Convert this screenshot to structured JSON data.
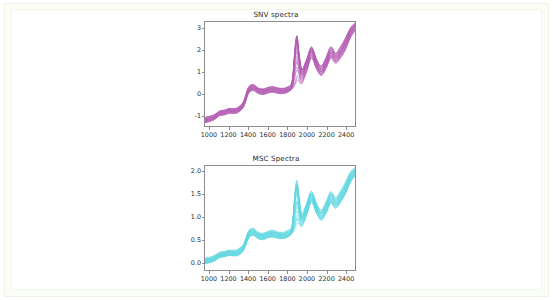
{
  "page": {
    "background_color": "#ffffff",
    "frame_color": "#eef4e6"
  },
  "figure": {
    "panels": [
      {
        "id": "snv",
        "title": "SNV spectra",
        "color": "#b45cb4"
      },
      {
        "id": "msc",
        "title": "MSC Spectra",
        "color": "#5fd6e0"
      }
    ]
  },
  "chart_data": [
    {
      "type": "line",
      "id": "snv-spectra",
      "title": "SNV spectra",
      "xlabel": "",
      "ylabel": "",
      "xlim": [
        950,
        2500
      ],
      "ylim": [
        -1.35,
        3.45
      ],
      "xticks": [
        1000,
        1200,
        1400,
        1600,
        1800,
        2000,
        2200,
        2400
      ],
      "yticks": [
        -1,
        0,
        1,
        2,
        3
      ],
      "grid": false,
      "legend": "none",
      "line_color": "#b45cb4",
      "n_series": 24,
      "x": [
        950,
        1000,
        1050,
        1100,
        1150,
        1200,
        1250,
        1300,
        1350,
        1400,
        1450,
        1500,
        1550,
        1600,
        1650,
        1700,
        1750,
        1800,
        1850,
        1880,
        1900,
        1920,
        1950,
        2000,
        2050,
        2100,
        2150,
        2200,
        2250,
        2300,
        2350,
        2400,
        2450,
        2500
      ],
      "series": [
        {
          "name": "sample-mean",
          "values": [
            -1.08,
            -1.02,
            -0.93,
            -0.76,
            -0.72,
            -0.64,
            -0.66,
            -0.58,
            -0.33,
            0.3,
            0.42,
            0.28,
            0.23,
            0.3,
            0.34,
            0.29,
            0.27,
            0.33,
            0.55,
            1.95,
            2.55,
            1.85,
            1.05,
            1.52,
            2.1,
            1.55,
            1.2,
            1.55,
            2.05,
            1.8,
            2.05,
            2.45,
            2.95,
            3.25
          ]
        },
        {
          "name": "sample-upper-envelope",
          "values": [
            -0.95,
            -0.9,
            -0.82,
            -0.66,
            -0.62,
            -0.54,
            -0.56,
            -0.46,
            -0.2,
            0.45,
            0.56,
            0.4,
            0.36,
            0.43,
            0.47,
            0.41,
            0.39,
            0.45,
            0.72,
            2.2,
            2.78,
            2.05,
            1.28,
            1.72,
            2.3,
            1.76,
            1.42,
            1.8,
            2.3,
            2.02,
            2.3,
            2.7,
            3.15,
            3.4
          ]
        },
        {
          "name": "sample-lower-envelope",
          "values": [
            -1.2,
            -1.14,
            -1.05,
            -0.88,
            -0.84,
            -0.76,
            -0.78,
            -0.7,
            -0.46,
            0.16,
            0.28,
            0.15,
            0.1,
            0.17,
            0.21,
            0.16,
            0.14,
            0.2,
            0.36,
            0.55,
            0.78,
            0.72,
            0.6,
            1.15,
            1.78,
            1.3,
            0.98,
            1.3,
            1.78,
            1.55,
            1.8,
            2.15,
            2.7,
            3.05
          ]
        }
      ]
    },
    {
      "type": "line",
      "id": "msc-spectra",
      "title": "MSC Spectra",
      "xlabel": "",
      "ylabel": "",
      "xlim": [
        950,
        2500
      ],
      "ylim": [
        -0.18,
        2.12
      ],
      "xticks": [
        1000,
        1200,
        1400,
        1600,
        1800,
        2000,
        2200,
        2400
      ],
      "yticks": [
        0.0,
        0.5,
        1.0,
        1.5,
        2.0
      ],
      "grid": false,
      "legend": "none",
      "line_color": "#5fd6e0",
      "n_series": 24,
      "x": [
        950,
        1000,
        1050,
        1100,
        1150,
        1200,
        1250,
        1300,
        1350,
        1400,
        1450,
        1500,
        1550,
        1600,
        1650,
        1700,
        1750,
        1800,
        1850,
        1880,
        1900,
        1920,
        1950,
        2000,
        2050,
        2100,
        2150,
        2200,
        2250,
        2300,
        2350,
        2400,
        2450,
        2500
      ],
      "series": [
        {
          "name": "sample-mean",
          "values": [
            0.02,
            0.04,
            0.08,
            0.15,
            0.17,
            0.2,
            0.19,
            0.22,
            0.33,
            0.6,
            0.66,
            0.58,
            0.56,
            0.6,
            0.62,
            0.59,
            0.58,
            0.61,
            0.72,
            1.38,
            1.65,
            1.33,
            0.95,
            1.18,
            1.45,
            1.19,
            1.03,
            1.19,
            1.42,
            1.3,
            1.43,
            1.62,
            1.86,
            2.0
          ]
        },
        {
          "name": "sample-upper-envelope",
          "values": [
            0.08,
            0.1,
            0.14,
            0.21,
            0.23,
            0.26,
            0.25,
            0.29,
            0.4,
            0.68,
            0.74,
            0.65,
            0.63,
            0.67,
            0.7,
            0.66,
            0.65,
            0.69,
            0.81,
            1.52,
            1.78,
            1.45,
            1.06,
            1.29,
            1.56,
            1.3,
            1.14,
            1.32,
            1.55,
            1.42,
            1.56,
            1.75,
            1.97,
            2.08
          ]
        },
        {
          "name": "sample-lower-envelope",
          "values": [
            -0.04,
            -0.02,
            0.02,
            0.09,
            0.11,
            0.14,
            0.13,
            0.15,
            0.26,
            0.52,
            0.58,
            0.51,
            0.49,
            0.53,
            0.55,
            0.52,
            0.51,
            0.54,
            0.63,
            0.72,
            0.86,
            0.83,
            0.78,
            1.02,
            1.32,
            1.08,
            0.92,
            1.07,
            1.29,
            1.18,
            1.31,
            1.49,
            1.74,
            1.9
          ]
        }
      ]
    }
  ]
}
